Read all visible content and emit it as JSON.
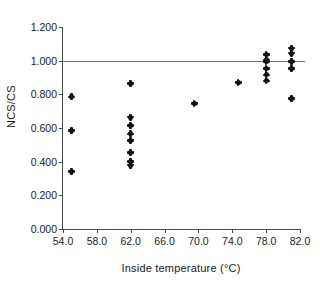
{
  "chart_data": {
    "type": "scatter",
    "title": "",
    "xlabel": "Inside temperature (°C)",
    "ylabel": "NCS/CS",
    "xlim": [
      54.0,
      82.0
    ],
    "ylim": [
      0.0,
      1.2
    ],
    "xticks": [
      54.0,
      58.0,
      62.0,
      66.0,
      70.0,
      74.0,
      78.0,
      82.0
    ],
    "xtick_labels": [
      "54.0",
      "58.0",
      "62.0",
      "66.0",
      "70.0",
      "74.0",
      "78.0",
      "82.0"
    ],
    "yticks": [
      0.0,
      0.2,
      0.4,
      0.6,
      0.8,
      1.0,
      1.2
    ],
    "ytick_labels": [
      "0.000",
      "0.200",
      "0.400",
      "0.600",
      "0.800",
      "1.000",
      "1.200"
    ],
    "grid": false,
    "legend": null,
    "marker": "diamond",
    "marker_color": "#111111",
    "reference_line": {
      "orientation": "horizontal",
      "y": 1.0,
      "color": "#6e6e6e",
      "x_start": 54.0,
      "x_end": 82.6
    },
    "points": [
      {
        "x": 55.0,
        "y": 0.785
      },
      {
        "x": 55.0,
        "y": 0.585
      },
      {
        "x": 55.0,
        "y": 0.34
      },
      {
        "x": 62.0,
        "y": 0.865
      },
      {
        "x": 62.0,
        "y": 0.665
      },
      {
        "x": 62.0,
        "y": 0.615
      },
      {
        "x": 62.0,
        "y": 0.565
      },
      {
        "x": 62.0,
        "y": 0.525
      },
      {
        "x": 62.0,
        "y": 0.455
      },
      {
        "x": 62.0,
        "y": 0.4
      },
      {
        "x": 62.0,
        "y": 0.38
      },
      {
        "x": 69.5,
        "y": 0.745
      },
      {
        "x": 74.7,
        "y": 0.87
      },
      {
        "x": 78.0,
        "y": 1.035
      },
      {
        "x": 78.0,
        "y": 1.005
      },
      {
        "x": 78.0,
        "y": 0.995
      },
      {
        "x": 78.0,
        "y": 0.955
      },
      {
        "x": 78.0,
        "y": 0.915
      },
      {
        "x": 78.0,
        "y": 0.88
      },
      {
        "x": 81.0,
        "y": 1.075
      },
      {
        "x": 81.0,
        "y": 1.045
      },
      {
        "x": 81.0,
        "y": 0.995
      },
      {
        "x": 81.0,
        "y": 0.955
      },
      {
        "x": 81.0,
        "y": 0.775
      }
    ]
  }
}
